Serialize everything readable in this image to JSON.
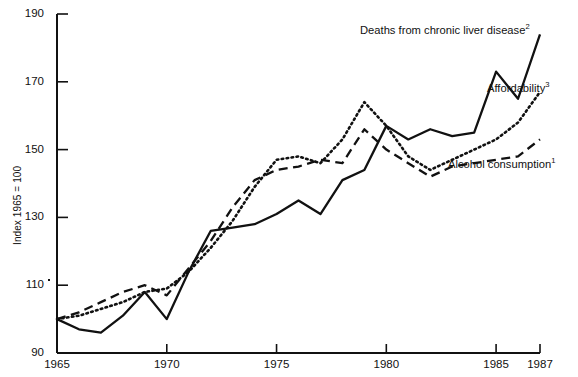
{
  "chart_data": {
    "type": "line",
    "title": "",
    "subtitle": "",
    "xlabel": "",
    "ylabel": "Index 1965 = 100",
    "xlim": [
      1965,
      1987
    ],
    "ylim": [
      90,
      190
    ],
    "yticks": [
      90,
      110,
      130,
      150,
      170,
      190
    ],
    "xticks": [
      1965,
      1970,
      1975,
      1980,
      1985,
      1987
    ],
    "ytick_labels": [
      "90",
      "110",
      "130",
      "150",
      "170",
      "190"
    ],
    "xtick_labels": [
      "1965",
      "1970",
      "1975",
      "1980",
      "1985",
      "1987"
    ],
    "grid": false,
    "legend_position": "inline-annotations",
    "x": [
      1965,
      1966,
      1967,
      1968,
      1969,
      1970,
      1971,
      1972,
      1973,
      1974,
      1975,
      1976,
      1977,
      1978,
      1979,
      1980,
      1981,
      1982,
      1983,
      1984,
      1985,
      1986,
      1987
    ],
    "series": [
      {
        "name": "Deaths from chronic liver disease",
        "footnote": "2",
        "style": "solid",
        "label_text": "Deaths from chronic liver disease",
        "values": [
          100,
          97,
          96,
          101,
          108,
          100,
          114,
          126,
          127,
          128,
          131,
          135,
          131,
          141,
          144,
          157,
          153,
          156,
          154,
          155,
          173,
          165,
          184
        ]
      },
      {
        "name": "Affordability",
        "footnote": "3",
        "style": "dotted",
        "label_text": "Affordability",
        "values": [
          100,
          101,
          103,
          105,
          108,
          109,
          114,
          121,
          129,
          139,
          147,
          148,
          146,
          153,
          164,
          157,
          148,
          144,
          147,
          150,
          153,
          158,
          167
        ]
      },
      {
        "name": "Alcohol consumption",
        "footnote": "1",
        "style": "dashed",
        "label_text": "Alcohol consumption",
        "values": [
          100,
          102,
          105,
          108,
          110,
          107,
          115,
          123,
          133,
          141,
          144,
          145,
          147,
          146,
          156,
          150,
          146,
          142,
          145,
          146,
          147,
          148,
          153
        ]
      }
    ],
    "annotations": [
      {
        "text": "Deaths from chronic liver disease",
        "footnote": "2",
        "x_px": 360,
        "y_px": 24
      },
      {
        "text": "Affordability",
        "footnote": "3",
        "x_px": 487,
        "y_px": 82
      },
      {
        "text": "Alcohol consumption",
        "footnote": "1",
        "x_px": 448,
        "y_px": 158
      }
    ]
  },
  "colors": {
    "ink": "#111111",
    "background": "#ffffff"
  }
}
